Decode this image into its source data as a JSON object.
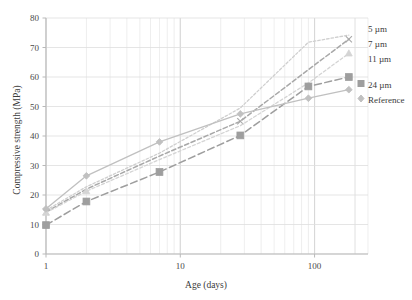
{
  "chart_data": {
    "type": "line",
    "title": "",
    "xlabel": "Age (days)",
    "ylabel": "Compressive strength (MPa)",
    "xscale": "log",
    "xlim": [
      1,
      250
    ],
    "ylim": [
      0,
      80
    ],
    "yticks": [
      0,
      10,
      20,
      30,
      40,
      50,
      60,
      70,
      80
    ],
    "xticks": [
      1,
      10,
      100
    ],
    "xtick_labels": [
      "1",
      "10",
      "100"
    ],
    "grid": true,
    "legend_position": "right",
    "x": [
      1,
      2,
      7,
      28,
      90,
      180
    ],
    "series": [
      {
        "name": "5 µm",
        "label": "5 µm",
        "color": "#cfcfcf",
        "marker": "none",
        "dash": "dotted",
        "values": [
          14.8,
          22.8,
          34.2,
          49.5,
          71.8,
          74.2
        ]
      },
      {
        "name": "7 µm",
        "label": "7 µm",
        "color": "#a8a8a8",
        "marker": "x",
        "dash": "dashed",
        "values": [
          14.2,
          22.0,
          33.2,
          45.0,
          62.5,
          72.8
        ]
      },
      {
        "name": "11 µm",
        "label": "11 µm",
        "color": "#d4d4d4",
        "marker": "triangle",
        "dash": "dashed-fine",
        "values": [
          14.0,
          21.3,
          32.0,
          43.5,
          58.0,
          68.0
        ]
      },
      {
        "name": "24 µm",
        "label": "24 µm",
        "color": "#9e9e9e",
        "marker": "square",
        "dash": "long-dash",
        "values": [
          9.8,
          17.8,
          27.8,
          40.2,
          56.8,
          60.0
        ]
      },
      {
        "name": "Reference",
        "label": "Reference",
        "color": "#c0c0c0",
        "marker": "diamond",
        "dash": "solid",
        "values": [
          15.3,
          26.5,
          38.0,
          47.5,
          52.8,
          55.7
        ]
      }
    ]
  },
  "axes": {
    "y_title": "Compressive strength (MPa)",
    "x_title": "Age (days)",
    "y_tick_labels": [
      "0",
      "10",
      "20",
      "30",
      "40",
      "50",
      "60",
      "70",
      "80"
    ],
    "x_tick_labels": [
      "1",
      "10",
      "100"
    ]
  },
  "legend": {
    "items": [
      {
        "label": "5 µm"
      },
      {
        "label": "7 µm"
      },
      {
        "label": "11 µm"
      },
      {
        "label": "24 µm"
      },
      {
        "label": "Reference"
      }
    ]
  },
  "colors": {
    "grid": "#e3e3e3",
    "axis": "#cccccc",
    "text": "#3a3a3a",
    "background": "#ffffff"
  }
}
